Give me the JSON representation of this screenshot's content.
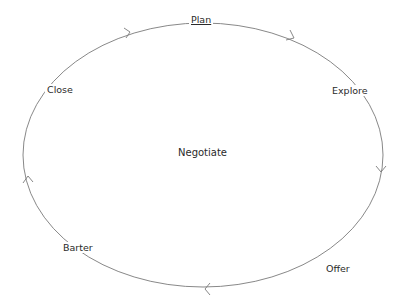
{
  "diagram": {
    "title_center": "Negotiate",
    "stages": [
      {
        "label": "Plan",
        "underlined": true
      },
      {
        "label": "Explore"
      },
      {
        "label": "Offer"
      },
      {
        "label": "Barter"
      },
      {
        "label": "Close"
      }
    ],
    "direction": "clockwise",
    "colors": {
      "line": "#7a7a7a",
      "text": "#2a2a2a",
      "background": "#ffffff"
    }
  }
}
